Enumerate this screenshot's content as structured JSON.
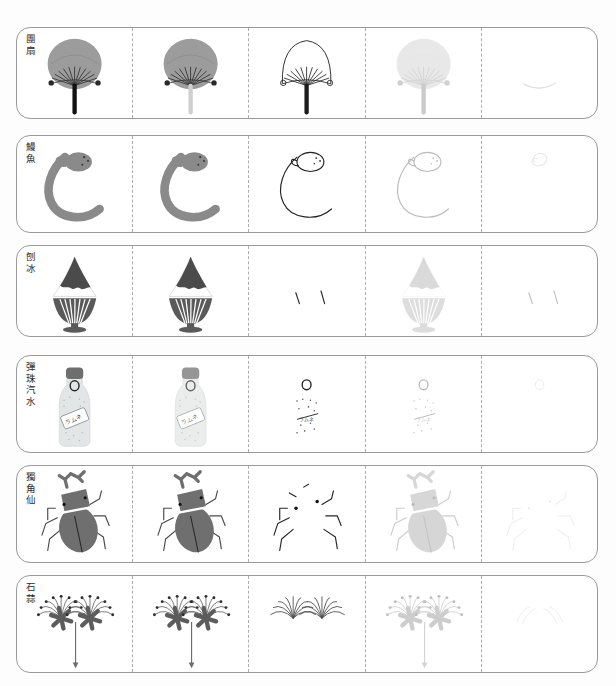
{
  "page": {
    "width": 616,
    "height": 686,
    "background": "#fdfdfd",
    "row_border_color": "#9a9a9a",
    "divider_color": "#adadad",
    "columns": 5,
    "rows": 6
  },
  "rows": [
    {
      "id": "round-fan",
      "label": "團扇",
      "subject": "round paper fan (uchiwa)",
      "top": 27,
      "height": 92,
      "colors": {
        "fill": "#9c9c9c",
        "line": "#1d1d1d",
        "handle": "#111111"
      },
      "stages": [
        {
          "name": "full-color",
          "opacity": 1.0,
          "mode": "filled"
        },
        {
          "name": "color-faded-handle",
          "opacity": 1.0,
          "mode": "filled-light-handle"
        },
        {
          "name": "outline-only",
          "opacity": 1.0,
          "mode": "outline"
        },
        {
          "name": "ghost",
          "opacity": 0.22,
          "mode": "filled"
        },
        {
          "name": "hint",
          "opacity": 0.35,
          "mode": "hint"
        }
      ]
    },
    {
      "id": "eel",
      "label": "鰻魚",
      "subject": "eel",
      "top": 135,
      "height": 98,
      "colors": {
        "fill": "#8a8a8a",
        "line": "#222222"
      },
      "stages": [
        {
          "name": "full-color",
          "opacity": 1.0,
          "mode": "filled"
        },
        {
          "name": "color-2",
          "opacity": 1.0,
          "mode": "filled"
        },
        {
          "name": "outline-only",
          "opacity": 1.0,
          "mode": "outline"
        },
        {
          "name": "ghost",
          "opacity": 0.3,
          "mode": "outline"
        },
        {
          "name": "hint",
          "opacity": 0.3,
          "mode": "hint"
        }
      ]
    },
    {
      "id": "shaved-ice",
      "label": "刨冰",
      "subject": "shaved ice dessert",
      "top": 245,
      "height": 92,
      "colors": {
        "fill": "#4b4b4b",
        "cup": "#5a5a5a",
        "line": "#222222"
      },
      "stages": [
        {
          "name": "full-color",
          "opacity": 1.0,
          "mode": "filled"
        },
        {
          "name": "color-2",
          "opacity": 1.0,
          "mode": "filled"
        },
        {
          "name": "fragments",
          "opacity": 1.0,
          "mode": "fragments"
        },
        {
          "name": "ghost",
          "opacity": 0.2,
          "mode": "filled"
        },
        {
          "name": "hint",
          "opacity": 0.28,
          "mode": "fragments"
        }
      ]
    },
    {
      "id": "ramune",
      "label": "彈珠汽水",
      "subject": "marble soda bottle (ramune)",
      "top": 355,
      "height": 98,
      "colors": {
        "fill": "#e3e6e6",
        "cap": "#6e6e6e",
        "line": "#222222"
      },
      "stages": [
        {
          "name": "full-color",
          "opacity": 1.0,
          "mode": "filled"
        },
        {
          "name": "color-2",
          "opacity": 0.72,
          "mode": "filled"
        },
        {
          "name": "marble-outline",
          "opacity": 1.0,
          "mode": "outline"
        },
        {
          "name": "ghost",
          "opacity": 0.3,
          "mode": "outline"
        },
        {
          "name": "hint",
          "opacity": 0.3,
          "mode": "hint"
        }
      ]
    },
    {
      "id": "rhinoceros-beetle",
      "label": "獨角仙",
      "subject": "rhinoceros beetle",
      "top": 465,
      "height": 98,
      "colors": {
        "fill": "#6f6f6f",
        "line": "#262626"
      },
      "stages": [
        {
          "name": "full-color",
          "opacity": 1.0,
          "mode": "filled"
        },
        {
          "name": "color-2",
          "opacity": 1.0,
          "mode": "filled"
        },
        {
          "name": "outline-only",
          "opacity": 1.0,
          "mode": "outline"
        },
        {
          "name": "ghost",
          "opacity": 0.28,
          "mode": "filled"
        },
        {
          "name": "hint",
          "opacity": 0.28,
          "mode": "hint"
        }
      ]
    },
    {
      "id": "spider-lily",
      "label": "石蒜",
      "subject": "red spider lily (lycoris)",
      "top": 575,
      "height": 98,
      "colors": {
        "fill": "#5c5c5c",
        "line": "#3a3a3a"
      },
      "stages": [
        {
          "name": "full-color",
          "opacity": 1.0,
          "mode": "filled"
        },
        {
          "name": "color-2",
          "opacity": 1.0,
          "mode": "filled"
        },
        {
          "name": "outline-only",
          "opacity": 1.0,
          "mode": "outline"
        },
        {
          "name": "ghost",
          "opacity": 0.3,
          "mode": "filled"
        },
        {
          "name": "hint",
          "opacity": 0.3,
          "mode": "hint"
        }
      ]
    }
  ]
}
